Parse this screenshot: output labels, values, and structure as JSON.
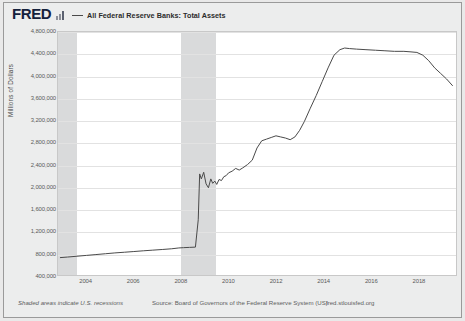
{
  "header": {
    "logo_text": "FRED",
    "logo_color": "#15213c",
    "bars_icon": "fred-bars-icon",
    "legend": {
      "line_color": "#4a4a4a",
      "label": "All Federal Reserve Banks: Total Assets"
    }
  },
  "footer": {
    "recession_note": "Shaded areas indicate U.S. recessions",
    "source": "Source: Board of Governors of the Federal Reserve System (US)",
    "url": "fred.stlouisfed.org"
  },
  "chart_data": {
    "type": "line",
    "title": "All Federal Reserve Banks: Total Assets",
    "xlabel": "",
    "ylabel": "Millions of Dollars",
    "ylim": [
      400000,
      4800000
    ],
    "xlim": [
      2002.8,
      2019.6
    ],
    "grid": true,
    "legend_position": "top",
    "line_color": "#4a4a4a",
    "plot_background": "#ffffff",
    "recession_shading_color": "#d9dadb",
    "ytick_labels": [
      "4,800,000",
      "4,400,000",
      "4,000,000",
      "3,600,000",
      "3,200,000",
      "2,800,000",
      "2,400,000",
      "2,000,000",
      "1,600,000",
      "1,200,000",
      "800,000",
      "400,000"
    ],
    "ytick_values": [
      4800000,
      4400000,
      4000000,
      3600000,
      3200000,
      2800000,
      2400000,
      2000000,
      1600000,
      1200000,
      800000,
      400000
    ],
    "xtick_labels": [
      "2004",
      "2006",
      "2008",
      "2010",
      "2012",
      "2014",
      "2016",
      "2018"
    ],
    "xtick_values": [
      2004,
      2006,
      2008,
      2010,
      2012,
      2014,
      2016,
      2018
    ],
    "recessions": [
      {
        "start": 2001.0,
        "end": 2003.6
      },
      {
        "start": 2007.95,
        "end": 2009.45
      }
    ],
    "series": [
      {
        "name": "All Federal Reserve Banks: Total Assets",
        "x": [
          2002.9,
          2003.2,
          2003.6,
          2004.0,
          2004.4,
          2004.8,
          2005.2,
          2005.6,
          2006.0,
          2006.4,
          2006.8,
          2007.2,
          2007.6,
          2007.9,
          2008.1,
          2008.35,
          2008.6,
          2008.72,
          2008.78,
          2008.85,
          2008.95,
          2009.05,
          2009.15,
          2009.25,
          2009.33,
          2009.42,
          2009.5,
          2009.6,
          2009.7,
          2009.8,
          2009.9,
          2010.0,
          2010.15,
          2010.3,
          2010.45,
          2010.6,
          2010.8,
          2011.0,
          2011.2,
          2011.4,
          2011.6,
          2011.8,
          2012.0,
          2012.2,
          2012.4,
          2012.6,
          2012.8,
          2013.0,
          2013.2,
          2013.45,
          2013.7,
          2013.95,
          2014.2,
          2014.45,
          2014.7,
          2014.9,
          2015.1,
          2015.4,
          2015.8,
          2016.2,
          2016.6,
          2017.0,
          2017.4,
          2017.7,
          2017.95,
          2018.2,
          2018.45,
          2018.7,
          2018.95,
          2019.2,
          2019.45
        ],
        "y": [
          715000,
          725000,
          740000,
          755000,
          770000,
          785000,
          800000,
          812000,
          825000,
          838000,
          850000,
          862000,
          875000,
          890000,
          895000,
          900000,
          905000,
          1400000,
          2230000,
          2140000,
          2260000,
          2050000,
          1980000,
          2140000,
          2060000,
          2100000,
          2040000,
          2130000,
          2110000,
          2180000,
          2200000,
          2250000,
          2280000,
          2330000,
          2300000,
          2340000,
          2400000,
          2480000,
          2700000,
          2830000,
          2860000,
          2890000,
          2920000,
          2900000,
          2880000,
          2850000,
          2900000,
          3020000,
          3180000,
          3420000,
          3650000,
          3900000,
          4150000,
          4380000,
          4480000,
          4510000,
          4500000,
          4490000,
          4480000,
          4470000,
          4460000,
          4450000,
          4450000,
          4440000,
          4430000,
          4380000,
          4280000,
          4150000,
          4050000,
          3950000,
          3830000
        ]
      }
    ]
  }
}
